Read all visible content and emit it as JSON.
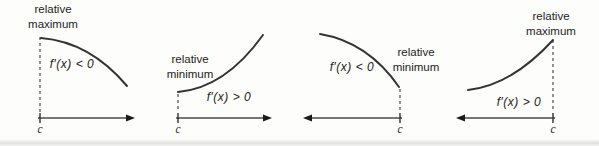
{
  "colors": {
    "curve_stroke": "#333333",
    "axis_stroke": "#4a4a4a",
    "arrowhead_fill": "#1a1a1a",
    "text": "#1c1c1c",
    "background": "#fdfdfc"
  },
  "panels": [
    {
      "extremum_line1": "relative",
      "extremum_line2": "maximum",
      "derivative_label": "f′(x) < 0",
      "c_label": "c",
      "curve_behavior": "decreasing",
      "arrow_direction": "right"
    },
    {
      "extremum_line1": "relative",
      "extremum_line2": "minimum",
      "derivative_label": "f′(x) > 0",
      "c_label": "c",
      "curve_behavior": "increasing",
      "arrow_direction": "right"
    },
    {
      "extremum_line1": "relative",
      "extremum_line2": "minimum",
      "derivative_label": "f′(x) < 0",
      "c_label": "c",
      "curve_behavior": "decreasing",
      "arrow_direction": "left"
    },
    {
      "extremum_line1": "relative",
      "extremum_line2": "maximum",
      "derivative_label": "f′(x) > 0",
      "c_label": "c",
      "curve_behavior": "increasing",
      "arrow_direction": "left"
    }
  ]
}
